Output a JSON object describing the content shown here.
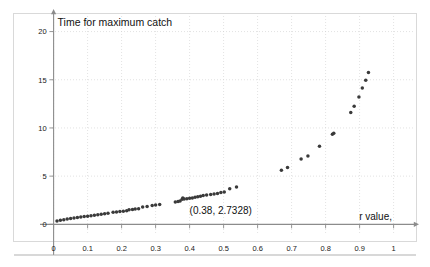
{
  "figure": {
    "background_color": "#ffffff",
    "frame_color": "#d9d9d9",
    "point_color": "#3a3a3a",
    "grid_color": "#cfcfcf",
    "axis_color": "#8c8c8c"
  },
  "chart_data": {
    "type": "scatter",
    "title": "Time for maximum catch",
    "xlabel": "r value,",
    "ylabel": "",
    "xlim": [
      -0.04,
      1.06
    ],
    "ylim": [
      -0.9,
      21.2
    ],
    "grid": true,
    "legend": null,
    "xticks": [
      "0",
      "0.1",
      "0.2",
      "0.3",
      "0.4",
      "0.5",
      "0.6",
      "0.7",
      "0.8",
      "0.9",
      "1"
    ],
    "xtick_values": [
      0,
      0.1,
      0.2,
      0.3,
      0.4,
      0.5,
      0.6,
      0.7,
      0.8,
      0.9,
      1
    ],
    "yticks": [
      "0",
      "5",
      "10",
      "15",
      "20"
    ],
    "ytick_values": [
      0,
      5,
      10,
      15,
      20
    ],
    "annotations": [
      {
        "text": "(0.38, 2.7328)",
        "x": 0.38,
        "y": 2.7328,
        "label_x": 0.4,
        "label_y": 1.1
      }
    ],
    "series": [
      {
        "name": "time for maximum catch",
        "marker": "circle",
        "color": "#3a3a3a",
        "points": [
          [
            0.01,
            0.35
          ],
          [
            0.02,
            0.42
          ],
          [
            0.03,
            0.48
          ],
          [
            0.04,
            0.54
          ],
          [
            0.05,
            0.6
          ],
          [
            0.06,
            0.65
          ],
          [
            0.07,
            0.7
          ],
          [
            0.08,
            0.75
          ],
          [
            0.09,
            0.8
          ],
          [
            0.1,
            0.85
          ],
          [
            0.11,
            0.9
          ],
          [
            0.12,
            0.95
          ],
          [
            0.13,
            1.0
          ],
          [
            0.14,
            1.05
          ],
          [
            0.15,
            1.1
          ],
          [
            0.16,
            1.15
          ],
          [
            0.175,
            1.25
          ],
          [
            0.185,
            1.28
          ],
          [
            0.195,
            1.32
          ],
          [
            0.205,
            1.36
          ],
          [
            0.215,
            1.42
          ],
          [
            0.222,
            1.5
          ],
          [
            0.232,
            1.54
          ],
          [
            0.24,
            1.58
          ],
          [
            0.25,
            1.62
          ],
          [
            0.262,
            1.8
          ],
          [
            0.275,
            1.85
          ],
          [
            0.29,
            1.95
          ],
          [
            0.3,
            2.0
          ],
          [
            0.312,
            2.05
          ],
          [
            0.358,
            2.32
          ],
          [
            0.366,
            2.36
          ],
          [
            0.372,
            2.42
          ],
          [
            0.378,
            2.6
          ],
          [
            0.38,
            2.7328
          ],
          [
            0.384,
            2.62
          ],
          [
            0.392,
            2.66
          ],
          [
            0.4,
            2.7
          ],
          [
            0.408,
            2.74
          ],
          [
            0.416,
            2.8
          ],
          [
            0.424,
            2.86
          ],
          [
            0.432,
            2.92
          ],
          [
            0.44,
            2.98
          ],
          [
            0.45,
            3.05
          ],
          [
            0.462,
            3.1
          ],
          [
            0.472,
            3.14
          ],
          [
            0.482,
            3.2
          ],
          [
            0.492,
            3.3
          ],
          [
            0.502,
            3.36
          ],
          [
            0.518,
            3.7
          ],
          [
            0.538,
            3.88
          ],
          [
            0.67,
            5.6
          ],
          [
            0.688,
            5.9
          ],
          [
            0.728,
            6.78
          ],
          [
            0.748,
            7.1
          ],
          [
            0.782,
            8.1
          ],
          [
            0.82,
            9.35
          ],
          [
            0.824,
            9.45
          ],
          [
            0.874,
            11.6
          ],
          [
            0.884,
            12.25
          ],
          [
            0.898,
            13.2
          ],
          [
            0.908,
            14.15
          ],
          [
            0.918,
            14.95
          ],
          [
            0.926,
            15.75
          ]
        ]
      }
    ]
  }
}
